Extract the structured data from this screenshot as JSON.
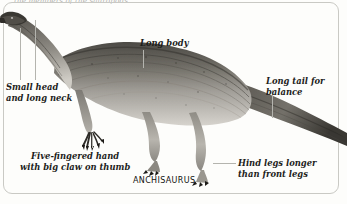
{
  "page": {
    "width": 347,
    "height": 204,
    "background_color": "#fdfdfb",
    "frame_color": "#c9c9c4",
    "text_color": "#1d1d1b",
    "leader_line_color": "#b4b4ae"
  },
  "top_clipped_text": "the members of the sauropods",
  "figure": {
    "species_caption": "ANCHISAURUS",
    "illustration_name": "anchisaurus-illustration",
    "illustration_description": "Grayscale side-view illustration of an Anchisaurus dinosaur walking to the left, with small head, long neck, striped long body, long tapering tail extending off the right edge, five-fingered front hands and larger hind legs."
  },
  "annotations": [
    {
      "id": "small-head",
      "lines": [
        "Small head",
        "and long neck"
      ]
    },
    {
      "id": "long-body",
      "lines": [
        "Long body"
      ]
    },
    {
      "id": "long-tail",
      "lines": [
        "Long tail for",
        "balance"
      ]
    },
    {
      "id": "five-fingered-hand",
      "lines": [
        "Five-fingered hand",
        "with big claw on thumb"
      ]
    },
    {
      "id": "hind-legs",
      "lines": [
        "Hind legs longer",
        "than front legs"
      ]
    }
  ]
}
